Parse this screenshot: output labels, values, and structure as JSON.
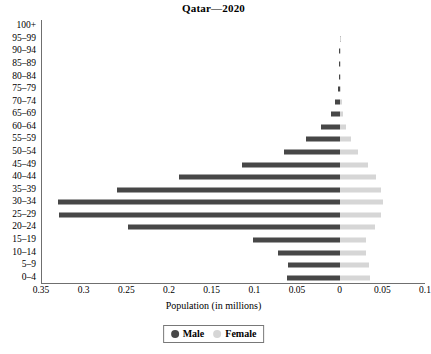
{
  "chart_data": {
    "type": "bar",
    "subtype": "population-pyramid",
    "title": "Qatar—2020",
    "xlabel": "Population (in millions)",
    "ylabel": "",
    "grid": false,
    "legend_position": "bottom",
    "legend": [
      "Male",
      "Female"
    ],
    "colors": {
      "male": "#474747",
      "female": "#d6d6d6",
      "axis": "#6f6f6f",
      "background": "#ffffff",
      "text": "#000000"
    },
    "categories": [
      "100+",
      "95–99",
      "90–94",
      "85–89",
      "80–84",
      "75–79",
      "70–74",
      "65–69",
      "60–64",
      "55–59",
      "50–54",
      "45–49",
      "40–44",
      "35–39",
      "30–34",
      "25–29",
      "20–24",
      "15–19",
      "10–14",
      "5–9",
      "0–4"
    ],
    "series": [
      {
        "name": "Male",
        "side": "left",
        "values": [
          0.0,
          0.0001,
          0.0002,
          0.0005,
          0.0011,
          0.0024,
          0.0049,
          0.0102,
          0.0215,
          0.04,
          0.065,
          0.115,
          0.188,
          0.261,
          0.33,
          0.329,
          0.248,
          0.102,
          0.072,
          0.061,
          0.062
        ]
      },
      {
        "name": "Female",
        "side": "right",
        "values": [
          0.0,
          0.0001,
          0.0002,
          0.0004,
          0.0008,
          0.0013,
          0.0022,
          0.0038,
          0.0072,
          0.0135,
          0.0215,
          0.033,
          0.043,
          0.048,
          0.0505,
          0.049,
          0.042,
          0.031,
          0.0305,
          0.034,
          0.035
        ]
      }
    ],
    "x_axis": {
      "left_max": 0.35,
      "right_max": 0.1,
      "tick_values": [
        0.35,
        0.3,
        0.25,
        0.2,
        0.15,
        0.1,
        0.05,
        0,
        0.05,
        0.1
      ],
      "tick_labels": [
        "0.35",
        "0.3",
        "0.25",
        "0.2",
        "0.15",
        "0.1",
        "0.05",
        "0",
        "0.05",
        "0.1"
      ]
    }
  }
}
